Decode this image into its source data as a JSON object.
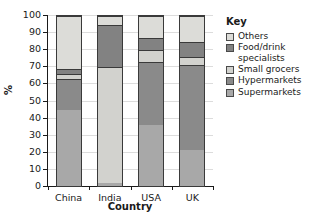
{
  "chart_data": {
    "type": "bar",
    "subtype": "stacked-100-percent",
    "title": "",
    "xlabel": "Country",
    "ylabel": "%",
    "categories": [
      "China",
      "India",
      "USA",
      "UK"
    ],
    "ylim": [
      0,
      100
    ],
    "ytick_values": [
      0,
      10,
      20,
      30,
      40,
      50,
      60,
      70,
      80,
      90,
      100
    ],
    "ytick_labels": [
      "0",
      "10",
      "20",
      "30",
      "40",
      "50",
      "60",
      "70",
      "80",
      "90",
      "100"
    ],
    "grid": true,
    "legend_position": "right",
    "legend_title": "Key",
    "stack_order_bottom_to_top": [
      "Supermarkets",
      "Hypermarkets",
      "Small grocers",
      "Food/drink specialists",
      "Others"
    ],
    "series": [
      {
        "name": "Supermarkets",
        "color": "#a8a8a8",
        "values": [
          45,
          2,
          36,
          21
        ]
      },
      {
        "name": "Hypermarkets",
        "color": "#8a8a8a",
        "values": [
          18,
          0,
          37,
          50
        ]
      },
      {
        "name": "Small grocers",
        "color": "#d2d2ce",
        "values": [
          3,
          68,
          7,
          5
        ]
      },
      {
        "name": "Food/drink specialists",
        "color": "#828282",
        "values": [
          3,
          25,
          7,
          9
        ]
      },
      {
        "name": "Others",
        "color": "#dcdcd8",
        "values": [
          31,
          5,
          13,
          15
        ]
      }
    ]
  },
  "legend": {
    "title": "Key",
    "items": [
      {
        "label": "Others",
        "color": "#dcdcd8"
      },
      {
        "label": "Food/drink specialists",
        "color": "#828282"
      },
      {
        "label": "Small grocers",
        "color": "#d2d2ce"
      },
      {
        "label": "Hypermarkets",
        "color": "#8a8a8a"
      },
      {
        "label": "Supermarkets",
        "color": "#a8a8a8"
      }
    ]
  },
  "axes": {
    "x_title": "Country",
    "y_title": "%"
  }
}
